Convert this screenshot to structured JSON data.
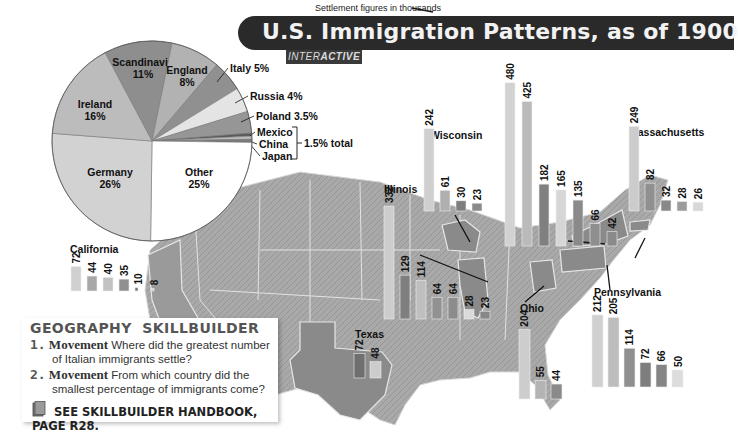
{
  "header": {
    "title": "U.S. Immigration Patterns, as of 1900",
    "tag_prefix": "INTER",
    "tag_bold": "ACTIVE"
  },
  "colors": {
    "title_bg": "#2a2a2a",
    "map_land": "#a8a8a8",
    "state_highlight": "#8c8c8c"
  },
  "chart_data": [
    {
      "type": "pie",
      "title": "Origin of immigrants",
      "slices": [
        {
          "label": "Scandinavia",
          "value": 11,
          "display": "11%",
          "color": "#8e8e8e"
        },
        {
          "label": "England",
          "value": 8,
          "display": "8%",
          "color": "#b2b2b2"
        },
        {
          "label": "Italy",
          "value": 5,
          "display": "Italy 5%",
          "color": "#909090"
        },
        {
          "label": "Russia",
          "value": 4,
          "display": "Russia 4%",
          "color": "#e4e4e4"
        },
        {
          "label": "Poland",
          "value": 3.5,
          "display": "Poland 3.5%",
          "color": "#969696"
        },
        {
          "label": "Mexico",
          "value": 0.5,
          "display": "Mexico",
          "color": "#5a5a5a"
        },
        {
          "label": "China",
          "value": 0.5,
          "display": "China",
          "color": "#bdbdbd"
        },
        {
          "label": "Japan",
          "value": 0.5,
          "display": "Japan",
          "color": "#7a7a7a"
        },
        {
          "label": "Other",
          "value": 25,
          "display": "25%",
          "color": "#ffffff"
        },
        {
          "label": "Germany",
          "value": 26,
          "display": "26%",
          "color": "#d2d2d2"
        },
        {
          "label": "Ireland",
          "value": 16,
          "display": "16%",
          "color": "#bcbcbc"
        }
      ],
      "bracket_label": "1.5% total"
    },
    {
      "type": "bar",
      "title": "Settlement by state",
      "unit_note": "Settlement figures in thousands",
      "states": [
        {
          "name": "New York",
          "values": [
            480,
            425,
            182,
            165,
            135,
            66,
            42
          ]
        },
        {
          "name": "Wisconsin",
          "values": [
            242,
            61,
            30,
            23
          ]
        },
        {
          "name": "Massachusetts",
          "values": [
            249,
            82,
            32,
            28,
            26
          ]
        },
        {
          "name": "Illinois",
          "values": [
            332,
            129,
            114,
            64,
            64,
            28,
            23
          ]
        },
        {
          "name": "California",
          "values": [
            72,
            44,
            40,
            35,
            10,
            8
          ]
        },
        {
          "name": "Texas",
          "values": [
            72,
            48
          ]
        },
        {
          "name": "Ohio",
          "values": [
            204,
            55,
            44
          ]
        },
        {
          "name": "Pennsylvania",
          "values": [
            212,
            205,
            114,
            72,
            66,
            50
          ]
        }
      ]
    }
  ],
  "skillbuilder": {
    "heading": "GEOGRAPHY  SKILLBUILDER",
    "questions": [
      {
        "num": "1.",
        "keyword": "Movement",
        "line1": "Where did the greatest number",
        "line2": "of Italian immigrants settle?"
      },
      {
        "num": "2.",
        "keyword": "Movement",
        "line1": "From which country did the",
        "line2": "smallest percentage of immigrants come?"
      }
    ],
    "handbook": "SEE SKILLBUILDER HANDBOOK, PAGE R28."
  }
}
